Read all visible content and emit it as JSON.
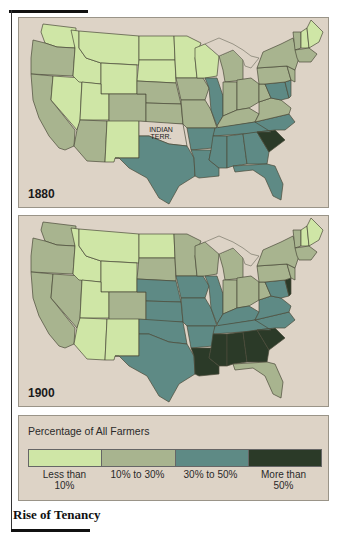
{
  "colors": {
    "background": "#ddd3c6",
    "cat1": "#cfe6a6",
    "cat2": "#a8b48f",
    "cat3": "#5e8a85",
    "cat4": "#2b3a28"
  },
  "maps": [
    {
      "year": "1880",
      "territory_label_1": "INDIAN",
      "territory_label_2": "TERR."
    },
    {
      "year": "1900"
    }
  ],
  "legend": {
    "title": "Percentage of All Farmers",
    "categories": [
      {
        "label_1": "Less than",
        "label_2": "10%",
        "color": "#cfe6a6"
      },
      {
        "label_1": "10% to 30%",
        "label_2": "",
        "color": "#a8b48f"
      },
      {
        "label_1": "30% to 50%",
        "label_2": "",
        "color": "#5e8a85"
      },
      {
        "label_1": "More than",
        "label_2": "50%",
        "color": "#2b3a28"
      }
    ]
  },
  "caption": "Rise of Tenancy",
  "state_categories": {
    "1880": {
      "WA": 1,
      "OR": 2,
      "CA": 2,
      "ID": 1,
      "MT": 1,
      "WY": 1,
      "NV": 1,
      "UT": 1,
      "CO": 2,
      "AZ": 2,
      "NM": 1,
      "ND": 1,
      "SD": 1,
      "NE": 2,
      "KS": 2,
      "IT": 0,
      "TX": 3,
      "MN": 1,
      "IA": 2,
      "MO": 2,
      "AR": 3,
      "LA": 3,
      "WI": 1,
      "IL": 3,
      "MI": 2,
      "IN": 2,
      "OH": 2,
      "KY": 2,
      "TN": 3,
      "MS": 3,
      "AL": 3,
      "GA": 3,
      "FL": 3,
      "SC": 4,
      "NC": 3,
      "VA": 2,
      "WV": 2,
      "MD": 3,
      "DE": 3,
      "PA": 2,
      "NJ": 2,
      "NY": 2,
      "NE_ENG": 2,
      "ME": 1,
      "NH": 1,
      "VT": 2
    },
    "1900": {
      "WA": 2,
      "OR": 2,
      "CA": 2,
      "ID": 1,
      "MT": 1,
      "WY": 1,
      "NV": 2,
      "UT": 1,
      "CO": 2,
      "AZ": 1,
      "NM": 1,
      "ND": 1,
      "SD": 2,
      "NE": 3,
      "KS": 3,
      "IT": 3,
      "TX": 3,
      "MN": 2,
      "IA": 3,
      "MO": 3,
      "AR": 3,
      "LA": 4,
      "WI": 2,
      "IL": 3,
      "MI": 2,
      "IN": 2,
      "OH": 2,
      "KY": 3,
      "TN": 3,
      "MS": 4,
      "AL": 4,
      "GA": 4,
      "FL": 2,
      "SC": 4,
      "NC": 3,
      "VA": 3,
      "WV": 2,
      "MD": 3,
      "DE": 4,
      "PA": 2,
      "NJ": 2,
      "NY": 2,
      "NE_ENG": 2,
      "ME": 1,
      "NH": 1,
      "VT": 2
    }
  }
}
